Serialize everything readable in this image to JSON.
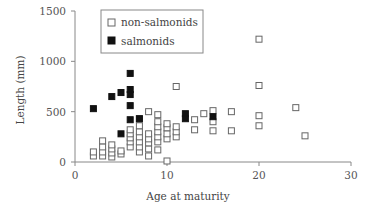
{
  "chart_data": {
    "type": "scatter",
    "title": "",
    "xlabel": "Age at maturity",
    "ylabel": "Length (mm)",
    "xlim": [
      0,
      30
    ],
    "ylim": [
      0,
      1500
    ],
    "xticks": [
      0,
      10,
      20,
      30
    ],
    "yticks": [
      0,
      500,
      1000,
      1500
    ],
    "grid": false,
    "legend_position": "upper-left-inside",
    "series": [
      {
        "name": "non-salmonids",
        "marker": "open-square",
        "points": [
          [
            2,
            60
          ],
          [
            2,
            100
          ],
          [
            3,
            60
          ],
          [
            3,
            100
          ],
          [
            3,
            150
          ],
          [
            3,
            210
          ],
          [
            4,
            50
          ],
          [
            4,
            90
          ],
          [
            4,
            130
          ],
          [
            4,
            170
          ],
          [
            5,
            80
          ],
          [
            5,
            110
          ],
          [
            6,
            150
          ],
          [
            6,
            200
          ],
          [
            6,
            240
          ],
          [
            6,
            280
          ],
          [
            6,
            320
          ],
          [
            7,
            100
          ],
          [
            7,
            150
          ],
          [
            7,
            200
          ],
          [
            7,
            250
          ],
          [
            7,
            300
          ],
          [
            7,
            360
          ],
          [
            7,
            430
          ],
          [
            8,
            60
          ],
          [
            8,
            130
          ],
          [
            8,
            190
          ],
          [
            8,
            230
          ],
          [
            8,
            280
          ],
          [
            8,
            500
          ],
          [
            9,
            120
          ],
          [
            9,
            200
          ],
          [
            9,
            250
          ],
          [
            9,
            300
          ],
          [
            9,
            350
          ],
          [
            9,
            400
          ],
          [
            9,
            470
          ],
          [
            10,
            10
          ],
          [
            10,
            230
          ],
          [
            10,
            280
          ],
          [
            10,
            340
          ],
          [
            10,
            380
          ],
          [
            11,
            250
          ],
          [
            11,
            300
          ],
          [
            11,
            350
          ],
          [
            11,
            750
          ],
          [
            13,
            320
          ],
          [
            13,
            420
          ],
          [
            14,
            480
          ],
          [
            15,
            310
          ],
          [
            15,
            400
          ],
          [
            15,
            510
          ],
          [
            17,
            310
          ],
          [
            17,
            500
          ],
          [
            20,
            360
          ],
          [
            20,
            460
          ],
          [
            20,
            760
          ],
          [
            20,
            1220
          ],
          [
            24,
            540
          ],
          [
            25,
            260
          ]
        ]
      },
      {
        "name": "salmonids",
        "marker": "filled-square",
        "points": [
          [
            2,
            530
          ],
          [
            4,
            650
          ],
          [
            5,
            690
          ],
          [
            5,
            280
          ],
          [
            6,
            880
          ],
          [
            6,
            720
          ],
          [
            6,
            670
          ],
          [
            6,
            560
          ],
          [
            6,
            420
          ],
          [
            7,
            430
          ],
          [
            12,
            480
          ],
          [
            12,
            430
          ],
          [
            15,
            450
          ]
        ]
      }
    ]
  },
  "legend": {
    "items": [
      {
        "label": "non-salmonids"
      },
      {
        "label": "salmonids"
      }
    ]
  },
  "axes": {
    "x_tick_labels": [
      "0",
      "10",
      "20",
      "30"
    ],
    "y_tick_labels": [
      "0",
      "500",
      "1000",
      "1500"
    ],
    "xlabel": "Age at maturity",
    "ylabel": "Length (mm)"
  },
  "colors": {
    "axis": "#888888",
    "open_marker_stroke": "#666666",
    "filled_marker": "#111111",
    "text": "#555555"
  }
}
